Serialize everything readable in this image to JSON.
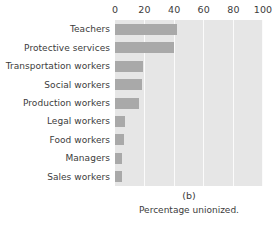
{
  "chart_data": {
    "type": "bar",
    "orientation": "horizontal",
    "title": "",
    "panel_letter": "(b)",
    "caption": "Percentage unionized.",
    "xlabel": "",
    "ylabel": "",
    "xlim": [
      0,
      100
    ],
    "xticks": [
      0,
      20,
      40,
      60,
      80,
      100
    ],
    "xtick_labels": [
      "0",
      "20",
      "40",
      "60",
      "80",
      "100"
    ],
    "grid": true,
    "grid_axis": "x",
    "legend": false,
    "plot_bgcolor": "#e6e6e6",
    "bar_color": "#a9a9a9",
    "gridline_color": "#fbfbfb",
    "categories": [
      "Teachers",
      "Protective services",
      "Transportation workers",
      "Social workers",
      "Production workers",
      "Legal workers",
      "Food workers",
      "Managers",
      "Sales workers"
    ],
    "values": [
      42,
      40,
      19,
      18,
      16,
      7,
      6,
      5,
      5
    ]
  }
}
